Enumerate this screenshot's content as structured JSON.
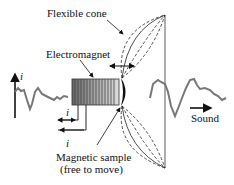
{
  "diagram": {
    "labels": {
      "flexible_cone": "Flexible cone",
      "electromagnet": "Electromagnet",
      "magnetic_sample_line1": "Magnetic sample",
      "magnetic_sample_line2": "(free to move)",
      "sound": "Sound",
      "current_axis": "i",
      "current_in": "i",
      "current_out": "i"
    },
    "colors": {
      "waveform": "#777777",
      "line": "#222222",
      "coil_dark": "#555555",
      "coil_light": "#bbbbbb"
    }
  }
}
